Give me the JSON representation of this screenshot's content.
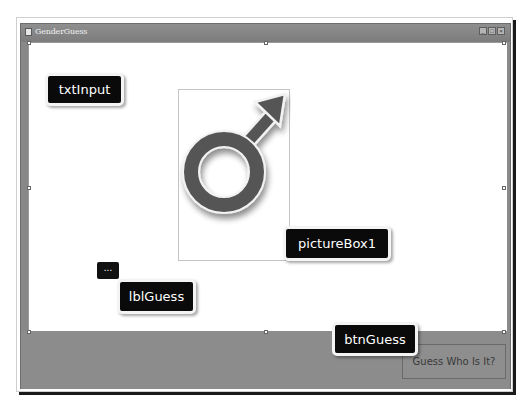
{
  "window": {
    "title": "GenderGuess",
    "controls": {
      "minimize": "_",
      "maximize": "□",
      "close": "×"
    }
  },
  "form": {
    "picture_box": {
      "icon": "male-symbol-icon"
    },
    "guess_button": {
      "label": "Guess Who Is It?"
    },
    "label_placeholder": "..."
  },
  "annotations": {
    "txt_input": "txtInput",
    "picture_box": "pictureBox1",
    "lbl_guess": "lblGuess",
    "btn_guess": "btnGuess"
  },
  "colors": {
    "callout_bg": "#0a0a0a",
    "window_frame": "#8a8a8a",
    "symbol": "#555555"
  }
}
